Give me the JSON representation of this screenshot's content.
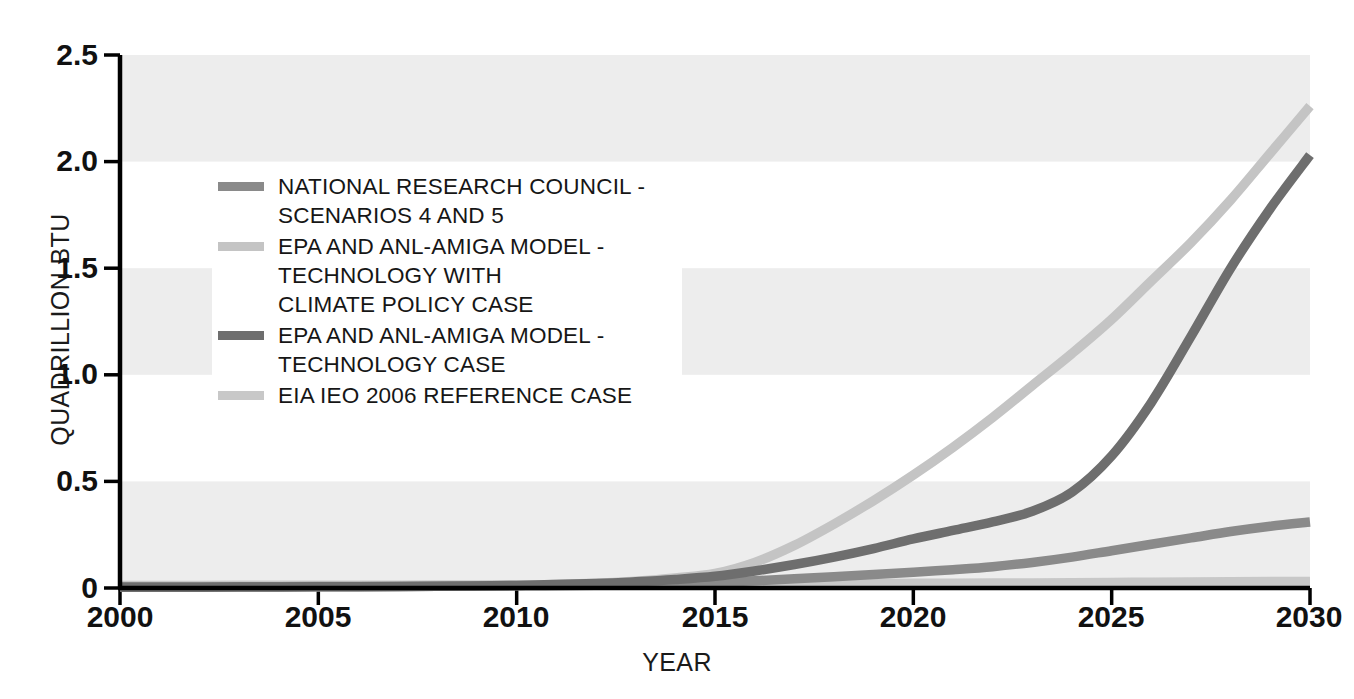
{
  "chart_data": {
    "type": "line",
    "title": "",
    "xlabel": "YEAR",
    "ylabel": "QUADRILLION BTU",
    "xlim": [
      2000,
      2030
    ],
    "ylim": [
      0,
      2.5
    ],
    "xticks": [
      "2000",
      "2005",
      "2010",
      "2015",
      "2020",
      "2025",
      "2030"
    ],
    "yticks": [
      "0",
      "0.5",
      "1.0",
      "1.5",
      "2.0",
      "2.5"
    ],
    "grid": false,
    "banding": "alternating light-grey horizontal bands at 0-0.5, 1.0-1.5, 2.0-2.5",
    "legend_position": "upper-left inside plot",
    "x": [
      2000,
      2002,
      2004,
      2006,
      2008,
      2010,
      2012,
      2013,
      2014,
      2015,
      2016,
      2017,
      2018,
      2019,
      2020,
      2021,
      2022,
      2023,
      2024,
      2025,
      2026,
      2027,
      2028,
      2029,
      2030
    ],
    "series": [
      {
        "name": "NATIONAL RESEARCH COUNCIL - SCENARIOS 4 AND 5",
        "color": "#8a8a8a",
        "values": [
          0.005,
          0.005,
          0.006,
          0.007,
          0.008,
          0.01,
          0.013,
          0.016,
          0.02,
          0.026,
          0.034,
          0.043,
          0.053,
          0.063,
          0.074,
          0.086,
          0.1,
          0.12,
          0.145,
          0.175,
          0.205,
          0.235,
          0.265,
          0.29,
          0.31
        ]
      },
      {
        "name": "EPA AND ANL-AMIGA MODEL - TECHNOLOGY WITH CLIMATE POLICY CASE",
        "color": "#c4c4c4",
        "values": [
          0.004,
          0.004,
          0.005,
          0.006,
          0.008,
          0.012,
          0.022,
          0.032,
          0.047,
          0.068,
          0.12,
          0.2,
          0.3,
          0.41,
          0.53,
          0.66,
          0.8,
          0.95,
          1.1,
          1.26,
          1.44,
          1.62,
          1.82,
          2.04,
          2.26
        ]
      },
      {
        "name": "EPA AND ANL-AMIGA MODEL - TECHNOLOGY CASE",
        "color": "#6e6e6e",
        "values": [
          0.004,
          0.004,
          0.005,
          0.006,
          0.008,
          0.012,
          0.021,
          0.029,
          0.04,
          0.055,
          0.08,
          0.11,
          0.145,
          0.185,
          0.23,
          0.27,
          0.31,
          0.36,
          0.45,
          0.62,
          0.87,
          1.18,
          1.5,
          1.78,
          2.03
        ]
      },
      {
        "name": "EIA IEO 2006 REFERENCE CASE",
        "color": "#c8c8c8",
        "values": [
          0.012,
          0.012,
          0.013,
          0.013,
          0.014,
          0.015,
          0.016,
          0.017,
          0.017,
          0.018,
          0.019,
          0.019,
          0.02,
          0.021,
          0.022,
          0.022,
          0.023,
          0.024,
          0.025,
          0.026,
          0.027,
          0.028,
          0.029,
          0.03,
          0.031
        ]
      }
    ]
  },
  "legend": {
    "items": [
      {
        "label": "NATIONAL RESEARCH COUNCIL -\nSCENARIOS 4 AND 5",
        "color": "#8a8a8a"
      },
      {
        "label": "EPA AND ANL-AMIGA MODEL -\nTECHNOLOGY WITH\nCLIMATE POLICY CASE",
        "color": "#c4c4c4"
      },
      {
        "label": "EPA AND ANL-AMIGA MODEL -\nTECHNOLOGY CASE",
        "color": "#6e6e6e"
      },
      {
        "label": "EIA IEO 2006 REFERENCE CASE",
        "color": "#c8c8c8"
      }
    ]
  },
  "style": {
    "axis_color": "#000000",
    "band_color": "#ededed",
    "background": "#ffffff"
  }
}
